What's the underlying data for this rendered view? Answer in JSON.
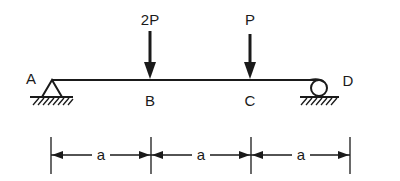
{
  "diagram": {
    "type": "simply-supported-beam",
    "beam": {
      "x_start": 52,
      "x_end": 325,
      "y": 80,
      "color": "#1a1a1a"
    },
    "supports": [
      {
        "id": "A",
        "kind": "pin",
        "label": "A"
      },
      {
        "id": "D",
        "kind": "roller",
        "label": "D"
      }
    ],
    "points": [
      {
        "id": "A",
        "label": "A"
      },
      {
        "id": "B",
        "label": "B"
      },
      {
        "id": "C",
        "label": "C"
      },
      {
        "id": "D",
        "label": "D"
      }
    ],
    "loads": [
      {
        "at": "B",
        "label": "2P",
        "direction": "down"
      },
      {
        "at": "C",
        "label": "P",
        "direction": "down"
      }
    ],
    "dimensions": [
      {
        "from": "A",
        "to": "B",
        "label": "a"
      },
      {
        "from": "B",
        "to": "C",
        "label": "a"
      },
      {
        "from": "C",
        "to": "D",
        "label": "a"
      }
    ]
  }
}
